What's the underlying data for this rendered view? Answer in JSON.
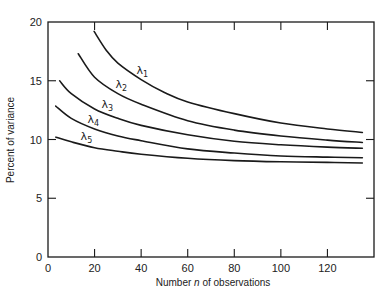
{
  "chart_data": {
    "type": "line",
    "title": "",
    "xlabel": "Number n of observations",
    "xlabel_parts": {
      "before": "Number ",
      "italic": "n",
      "after": " of observations"
    },
    "ylabel": "Percent of variance",
    "xlim": [
      0,
      140
    ],
    "ylim": [
      0,
      20
    ],
    "xticks": [
      0,
      20,
      40,
      60,
      80,
      100,
      120
    ],
    "yticks": [
      0,
      5,
      10,
      15,
      20
    ],
    "grid": false,
    "legend": "inline labels on curves",
    "series": [
      {
        "name": "λ1",
        "label_base": "λ",
        "label_sub": "1",
        "x": [
          19.8,
          25,
          30,
          40,
          50,
          60,
          80,
          100,
          120,
          135
        ],
        "y": [
          19.2,
          17.6,
          16.5,
          15.1,
          14.0,
          13.2,
          12.2,
          11.4,
          10.9,
          10.6
        ],
        "label_pos": [
          40.5,
          15.6
        ]
      },
      {
        "name": "λ2",
        "label_base": "λ",
        "label_sub": "2",
        "x": [
          13,
          20,
          30,
          40,
          60,
          80,
          100,
          120,
          135
        ],
        "y": [
          17.3,
          15.3,
          13.9,
          13.0,
          11.6,
          10.8,
          10.3,
          9.95,
          9.75
        ],
        "label_pos": [
          31.5,
          14.4
        ]
      },
      {
        "name": "λ3",
        "label_base": "λ",
        "label_sub": "3",
        "x": [
          5,
          10,
          20,
          30,
          40,
          60,
          80,
          100,
          120,
          135
        ],
        "y": [
          15.0,
          13.9,
          12.6,
          11.8,
          11.2,
          10.4,
          9.85,
          9.55,
          9.35,
          9.25
        ],
        "label_pos": [
          25.5,
          12.7
        ]
      },
      {
        "name": "λ4",
        "label_base": "λ",
        "label_sub": "4",
        "x": [
          3.3,
          10,
          20,
          30,
          40,
          60,
          80,
          100,
          120,
          135
        ],
        "y": [
          12.85,
          11.8,
          10.9,
          10.3,
          9.9,
          9.2,
          8.85,
          8.6,
          8.5,
          8.45
        ],
        "label_pos": [
          19.5,
          11.4
        ]
      },
      {
        "name": "λ5",
        "label_base": "λ",
        "label_sub": "5",
        "x": [
          3.4,
          10,
          20,
          30,
          40,
          60,
          80,
          100,
          120,
          135
        ],
        "y": [
          10.2,
          9.8,
          9.3,
          9.0,
          8.75,
          8.4,
          8.2,
          8.1,
          8.05,
          8.0
        ],
        "label_pos": [
          16.5,
          10.0
        ]
      }
    ]
  },
  "style": {
    "line_color": "#1a1a1a",
    "frame_color": "#1a1a1a",
    "background": "#ffffff"
  }
}
